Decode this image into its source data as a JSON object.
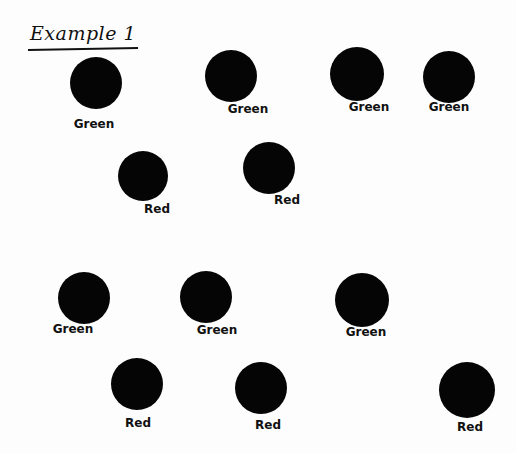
{
  "title": "Example 1",
  "colors": {
    "ink": "#050505",
    "paper": "#fdfdfd"
  },
  "dots": [
    {
      "label": "Green",
      "cx": 96,
      "cy": 83,
      "r": 26,
      "lx": 94,
      "ly": 117
    },
    {
      "label": "Green",
      "cx": 231,
      "cy": 76,
      "r": 26,
      "lx": 248,
      "ly": 102
    },
    {
      "label": "Green",
      "cx": 357,
      "cy": 74,
      "r": 27,
      "lx": 369,
      "ly": 100
    },
    {
      "label": "Green",
      "cx": 449,
      "cy": 77,
      "r": 26,
      "lx": 449,
      "ly": 100
    },
    {
      "label": "Red",
      "cx": 143,
      "cy": 176,
      "r": 25,
      "lx": 157,
      "ly": 202
    },
    {
      "label": "Red",
      "cx": 269,
      "cy": 168,
      "r": 26,
      "lx": 287,
      "ly": 193
    },
    {
      "label": "Green",
      "cx": 84,
      "cy": 298,
      "r": 26,
      "lx": 73,
      "ly": 322
    },
    {
      "label": "Green",
      "cx": 206,
      "cy": 297,
      "r": 26,
      "lx": 217,
      "ly": 323
    },
    {
      "label": "Green",
      "cx": 362,
      "cy": 300,
      "r": 27,
      "lx": 366,
      "ly": 325
    },
    {
      "label": "Red",
      "cx": 137,
      "cy": 384,
      "r": 26,
      "lx": 138,
      "ly": 416
    },
    {
      "label": "Red",
      "cx": 261,
      "cy": 388,
      "r": 26,
      "lx": 268,
      "ly": 418
    },
    {
      "label": "Red",
      "cx": 467,
      "cy": 390,
      "r": 28,
      "lx": 470,
      "ly": 420
    }
  ]
}
